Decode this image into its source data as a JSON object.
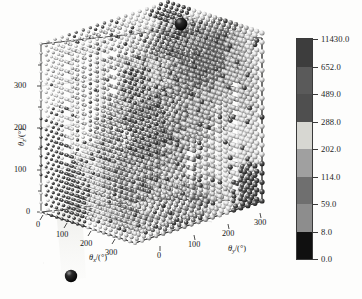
{
  "figure": {
    "type": "3d-scatter",
    "background_color": "#fdfdfc",
    "frame_color": "#2f2f2f"
  },
  "axes": {
    "x": {
      "label_theta": "θ",
      "label_sub": "x",
      "label_unit": "/(°)",
      "ticks": [
        "0",
        "100",
        "200",
        "300"
      ],
      "range": [
        0,
        360
      ]
    },
    "y": {
      "label_theta": "θ",
      "label_sub": "y",
      "label_unit": "/(°)",
      "ticks": [
        "0",
        "100",
        "200",
        "300"
      ],
      "range": [
        0,
        360
      ]
    },
    "z": {
      "label_theta": "θ",
      "label_sub": "z",
      "label_unit": "/(°)",
      "ticks": [
        "0",
        "100",
        "200",
        "300"
      ],
      "range": [
        0,
        360
      ]
    }
  },
  "colorbar": {
    "orientation": "vertical",
    "tick_labels": [
      "11430.0",
      "652.0",
      "489.0",
      "288.0",
      "202.0",
      "114.0",
      "59.0",
      "8.0",
      "0.0"
    ],
    "boundaries": [
      0.0,
      8.0,
      59.0,
      114.0,
      202.0,
      288.0,
      489.0,
      652.0,
      11430.0
    ],
    "band_colors": [
      "#101010",
      "#8d8d8d",
      "#6f6f6f",
      "#a0a0a0",
      "#d7d7d2",
      "#4f4f4f",
      "#5a5a5a",
      "#3d3d3d"
    ],
    "min_label": "0.0",
    "max_label": "11430.0"
  },
  "chart_data": {
    "type": "scatter",
    "title": "",
    "xlabel": "θx/(°)",
    "ylabel": "θy/(°)",
    "zlabel": "θz/(°)",
    "xlim": [
      0,
      360
    ],
    "ylim": [
      0,
      360
    ],
    "zlim": [
      0,
      360
    ],
    "xticks": [
      0,
      100,
      200,
      300
    ],
    "yticks": [
      0,
      100,
      200,
      300
    ],
    "zticks": [
      0,
      100,
      200,
      300
    ],
    "grid": true,
    "legend": "none",
    "colormap": "discrete-gray-8",
    "colorbar_boundaries": [
      0.0,
      8.0,
      59.0,
      114.0,
      202.0,
      288.0,
      489.0,
      652.0,
      11430.0
    ],
    "marker": "sphere",
    "grid_step_deg": 20,
    "point_count_approx": 2400,
    "annotations": [
      {
        "name": "outlier-top",
        "position_note": "above plot box, near x=0,y=0 top corner",
        "color": "#0d0d0d",
        "value_band": "0.0-8.0"
      },
      {
        "name": "outlier-bottom",
        "position_note": "below plot box, near x=0 front-left",
        "color": "#0d0d0d",
        "value_band": "0.0-8.0"
      }
    ]
  }
}
